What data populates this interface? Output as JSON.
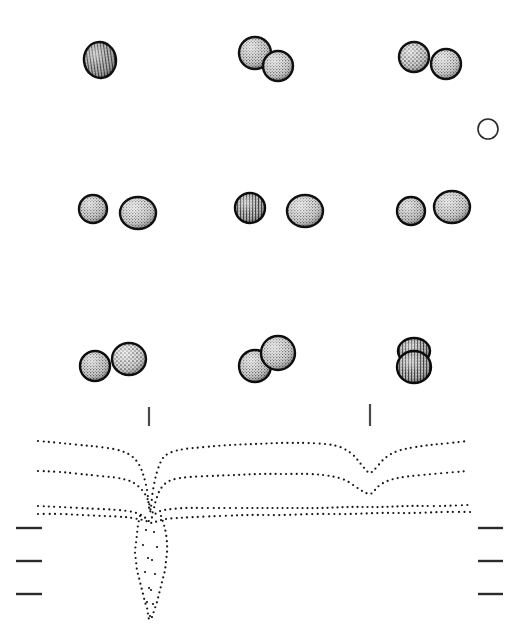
{
  "figure": {
    "title": "Stippled spheroidal specimens over dotted horizon profiles",
    "background_color": "#ffffff",
    "ink_color": "#1a1a1a",
    "stipple_color": "#3a3a3a",
    "outline_color": "#111111",
    "width": 523,
    "height": 635
  },
  "specimen_panels": [
    {
      "panel_id": "row1-col1",
      "row": 1,
      "column": 1,
      "count": 1,
      "specimens": [
        {
          "cx": 100,
          "cy": 60,
          "rx": 16,
          "ry": 18,
          "rotation": -8,
          "texture": "vertical-ribbed",
          "shade": "#5a5a5a",
          "rim": "#101010"
        }
      ]
    },
    {
      "panel_id": "row1-col2",
      "row": 1,
      "column": 2,
      "count": 2,
      "specimens": [
        {
          "cx": 255,
          "cy": 53,
          "rx": 16,
          "ry": 16,
          "rotation": 0,
          "texture": "fine-stipple",
          "shade": "#6a6a6a",
          "rim": "#101010"
        },
        {
          "cx": 278,
          "cy": 66,
          "rx": 15,
          "ry": 15,
          "rotation": 0,
          "texture": "fine-stipple",
          "shade": "#767676",
          "rim": "#101010"
        }
      ]
    },
    {
      "panel_id": "row1-col3",
      "row": 1,
      "column": 3,
      "count": 2,
      "specimens": [
        {
          "cx": 414,
          "cy": 57,
          "rx": 15,
          "ry": 15,
          "rotation": 0,
          "texture": "coarse-stipple",
          "shade": "#5e5e5e",
          "rim": "#101010"
        },
        {
          "cx": 446,
          "cy": 64,
          "rx": 15,
          "ry": 15,
          "rotation": 0,
          "texture": "fine-stipple",
          "shade": "#7a7a7a",
          "rim": "#101010"
        }
      ]
    },
    {
      "panel_id": "row2-col1",
      "row": 2,
      "column": 1,
      "count": 2,
      "specimens": [
        {
          "cx": 93,
          "cy": 209,
          "rx": 14,
          "ry": 14,
          "rotation": 0,
          "texture": "fine-stipple",
          "shade": "#636363",
          "rim": "#101010"
        },
        {
          "cx": 138,
          "cy": 213,
          "rx": 18,
          "ry": 16,
          "rotation": 0,
          "texture": "fine-stipple",
          "shade": "#7e7e7e",
          "rim": "#101010"
        }
      ]
    },
    {
      "panel_id": "row2-col2",
      "row": 2,
      "column": 2,
      "count": 2,
      "specimens": [
        {
          "cx": 250,
          "cy": 208,
          "rx": 15,
          "ry": 15,
          "rotation": 0,
          "texture": "vertical-ribbed",
          "shade": "#565656",
          "rim": "#0d0d0d"
        },
        {
          "cx": 305,
          "cy": 211,
          "rx": 18,
          "ry": 16,
          "rotation": 0,
          "texture": "fine-stipple",
          "shade": "#7c7c7c",
          "rim": "#101010"
        }
      ]
    },
    {
      "panel_id": "row2-col3",
      "row": 2,
      "column": 3,
      "count": 2,
      "specimens": [
        {
          "cx": 411,
          "cy": 211,
          "rx": 14,
          "ry": 14,
          "rotation": 0,
          "texture": "fine-stipple",
          "shade": "#5f5f5f",
          "rim": "#0d0d0d"
        },
        {
          "cx": 452,
          "cy": 207,
          "rx": 18,
          "ry": 16,
          "rotation": 0,
          "texture": "fine-stipple",
          "shade": "#7a7a7a",
          "rim": "#101010"
        }
      ]
    },
    {
      "panel_id": "row3-col1",
      "row": 3,
      "column": 1,
      "count": 2,
      "specimens": [
        {
          "cx": 95,
          "cy": 366,
          "rx": 15,
          "ry": 15,
          "rotation": 0,
          "texture": "fine-stipple",
          "shade": "#5c5c5c",
          "rim": "#0d0d0d"
        },
        {
          "cx": 129,
          "cy": 359,
          "rx": 17,
          "ry": 16,
          "rotation": 0,
          "texture": "coarse-stipple",
          "shade": "#737373",
          "rim": "#101010"
        }
      ]
    },
    {
      "panel_id": "row3-col2",
      "row": 3,
      "column": 2,
      "count": 2,
      "specimens": [
        {
          "cx": 255,
          "cy": 366,
          "rx": 16,
          "ry": 16,
          "rotation": 0,
          "texture": "fine-stipple",
          "shade": "#6b6b6b",
          "rim": "#0d0d0d"
        },
        {
          "cx": 278,
          "cy": 353,
          "rx": 17,
          "ry": 17,
          "rotation": 0,
          "texture": "fine-stipple",
          "shade": "#737373",
          "rim": "#0d0d0d"
        }
      ]
    },
    {
      "panel_id": "row3-col3",
      "row": 3,
      "column": 3,
      "count": 2,
      "specimens": [
        {
          "cx": 414,
          "cy": 351,
          "rx": 16,
          "ry": 13,
          "rotation": 0,
          "texture": "vertical-ribbed",
          "shade": "#4f4f4f",
          "rim": "#0a0a0a"
        },
        {
          "cx": 414,
          "cy": 367,
          "rx": 17,
          "ry": 16,
          "rotation": 0,
          "texture": "vertical-ribbed",
          "shade": "#5a5a5a",
          "rim": "#0a0a0a"
        }
      ]
    }
  ],
  "scale_marker": {
    "name": "open-circle-marker",
    "cx": 488,
    "cy": 129,
    "r": 10,
    "stroke": "#2b2b2b",
    "stroke_width": 1.6,
    "fill": "none"
  },
  "vertical_ticks": [
    {
      "id": "tick-left",
      "x": 149,
      "y1": 407,
      "y2": 426,
      "width": 2.2,
      "color": "#4a4a4a"
    },
    {
      "id": "tick-right",
      "x": 370,
      "y1": 404,
      "y2": 426,
      "width": 2.2,
      "color": "#4a4a4a"
    }
  ],
  "edge_ticks": {
    "left": [
      {
        "id": "left-tick-1",
        "x1": 16,
        "x2": 42,
        "y": 528
      },
      {
        "id": "left-tick-2",
        "x1": 16,
        "x2": 42,
        "y": 561
      },
      {
        "id": "left-tick-3",
        "x1": 16,
        "x2": 42,
        "y": 594
      }
    ],
    "right": [
      {
        "id": "right-tick-1",
        "x1": 478,
        "x2": 503,
        "y": 528
      },
      {
        "id": "right-tick-2",
        "x1": 478,
        "x2": 503,
        "y": 561
      },
      {
        "id": "right-tick-3",
        "x1": 478,
        "x2": 503,
        "y": 594
      }
    ],
    "thickness": 2.4,
    "color": "#2b2b2b"
  },
  "chart_data": {
    "type": "line",
    "xlabel": "",
    "ylabel": "",
    "xlim": [
      38,
      472
    ],
    "ylim": [
      440,
      620
    ],
    "grid": false,
    "legend": null,
    "render_style": "dotted",
    "dot_radius": 1.1,
    "dot_spacing": 5,
    "dot_color": "#151515",
    "series": [
      {
        "name": "horizon-1",
        "note": "uppermost dotted horizon; deep narrow V at x~150, shallow V at x~368",
        "x": [
          38,
          60,
          80,
          100,
          118,
          130,
          138,
          143,
          147,
          150,
          153,
          157,
          163,
          172,
          185,
          205,
          230,
          255,
          280,
          305,
          325,
          340,
          352,
          360,
          366,
          370,
          376,
          384,
          395,
          410,
          430,
          450,
          468
        ],
        "y": [
          441,
          443,
          445,
          447,
          450,
          455,
          463,
          474,
          490,
          512,
          490,
          472,
          458,
          452,
          449,
          447,
          445,
          444,
          443,
          443,
          444,
          447,
          454,
          463,
          470,
          473,
          468,
          459,
          452,
          448,
          445,
          443,
          441
        ]
      },
      {
        "name": "horizon-2",
        "note": "middle dotted horizon; V incisions slightly wider and lower",
        "x": [
          38,
          60,
          80,
          100,
          118,
          132,
          142,
          148,
          152,
          156,
          160,
          166,
          175,
          190,
          210,
          235,
          260,
          285,
          310,
          330,
          345,
          356,
          364,
          370,
          374,
          380,
          390,
          404,
          422,
          444,
          468
        ],
        "y": [
          471,
          472,
          474,
          476,
          478,
          482,
          490,
          500,
          513,
          500,
          490,
          483,
          479,
          477,
          476,
          475,
          474,
          474,
          474,
          476,
          480,
          487,
          492,
          494,
          491,
          485,
          480,
          477,
          475,
          473,
          471
        ]
      },
      {
        "name": "horizon-3",
        "note": "lower dotted horizon; single deep V at x~150, nearly flat to the right",
        "x": [
          38,
          60,
          80,
          100,
          118,
          133,
          143,
          149,
          153,
          158,
          164,
          172,
          185,
          205,
          230,
          260,
          290,
          320,
          350,
          380,
          410,
          440,
          468
        ],
        "y": [
          506,
          507,
          508,
          509,
          510,
          512,
          516,
          521,
          516,
          512,
          510,
          509,
          508,
          508,
          508,
          508,
          508,
          508,
          507,
          507,
          506,
          506,
          505
        ]
      },
      {
        "name": "horizon-4",
        "note": "deepest dotted horizon; flat right flank, canyon apex descends off-scale",
        "x": [
          38,
          60,
          82,
          104,
          124,
          138,
          146,
          152,
          158,
          166,
          178,
          196,
          220,
          250,
          282,
          315,
          348,
          380,
          412,
          444,
          470
        ],
        "y": [
          514,
          514,
          515,
          516,
          517,
          519,
          521,
          523,
          521,
          519,
          518,
          517,
          516,
          515,
          515,
          514,
          514,
          513,
          513,
          512,
          512
        ]
      },
      {
        "name": "canyon-left-flank",
        "note": "dotted left wall of the deep incision descending below the horizons",
        "x": [
          140,
          138,
          137,
          136,
          135,
          136,
          137,
          139,
          141,
          143,
          145,
          147,
          148,
          149
        ],
        "y": [
          516,
          525,
          534,
          543,
          552,
          561,
          570,
          578,
          586,
          594,
          602,
          608,
          614,
          620
        ]
      },
      {
        "name": "canyon-right-flank",
        "note": "dotted right wall of the deep incision descending below the horizons",
        "x": [
          161,
          164,
          166,
          167,
          167,
          166,
          165,
          163,
          161,
          159,
          157,
          155,
          153,
          151
        ],
        "y": [
          516,
          525,
          534,
          543,
          552,
          561,
          570,
          578,
          586,
          594,
          602,
          608,
          614,
          620
        ]
      },
      {
        "name": "canyon-axis-fill",
        "note": "scattered dots inside the incision axis",
        "x": [
          146,
          154,
          143,
          157,
          148,
          152,
          145,
          155,
          149,
          151,
          147,
          153,
          150
        ],
        "y": [
          530,
          532,
          545,
          547,
          558,
          560,
          572,
          574,
          588,
          590,
          602,
          604,
          616
        ]
      }
    ]
  }
}
